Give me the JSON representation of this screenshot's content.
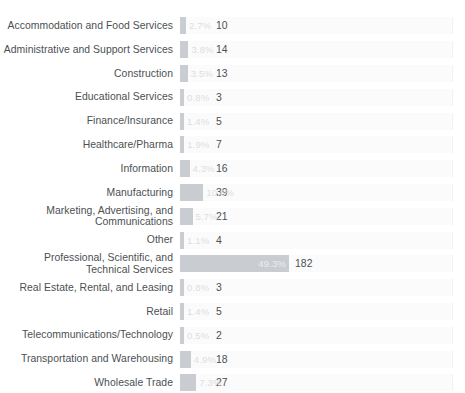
{
  "chart_data": {
    "type": "bar",
    "orientation": "horizontal",
    "title": "",
    "subtitle": "",
    "xlabel": "",
    "ylabel": "",
    "grid": false,
    "legend": null,
    "xlim": [
      0,
      49.3
    ],
    "value_unit": "percent",
    "categories": [
      "Accommodation and Food Services",
      "Administrative and Support Services",
      "Construction",
      "Educational Services",
      "Finance/Insurance",
      "Healthcare/Pharma",
      "Information",
      "Manufacturing",
      "Marketing, Advertising, and\nCommunications",
      "Other",
      "Professional, Scientific, and\nTechnical Services",
      "Real Estate, Rental, and Leasing",
      "Retail",
      "Telecommunications/Technology",
      "Transportation and Warehousing",
      "Wholesale Trade"
    ],
    "values": [
      2.7,
      3.8,
      3.5,
      0.8,
      1.4,
      1.9,
      4.3,
      10.6,
      5.7,
      1.1,
      49.3,
      0.8,
      1.4,
      0.5,
      4.9,
      7.3
    ],
    "counts": [
      10,
      14,
      13,
      3,
      5,
      7,
      16,
      39,
      21,
      4,
      182,
      3,
      5,
      2,
      18,
      27
    ],
    "percent_labels": [
      "2.7%",
      "3.8%",
      "3.5%",
      "0.8%",
      "1.4%",
      "1.9%",
      "4.3%",
      "10.6%",
      "5.7%",
      "1.1%",
      "49.3%",
      "0.8%",
      "1.4%",
      "0.5%",
      "4.9%",
      "7.3%"
    ],
    "count_labels": [
      "10",
      "14",
      "13",
      "3",
      "5",
      "7",
      "16",
      "39",
      "21",
      "4",
      "182",
      "3",
      "5",
      "2",
      "18",
      "27"
    ]
  },
  "style": {
    "bar_color": "#c9ccd0",
    "track_color": "#fbfbfc",
    "track_border_color": "#f2f2f4",
    "label_color": "#4c4f52",
    "percent_label_color": "#eceef0",
    "background": "#ffffff"
  },
  "rows": [
    {
      "label": "Accommodation and Food Services",
      "percent": "2.7%",
      "count": "10",
      "value": 2.7
    },
    {
      "label": "Administrative and Support Services",
      "percent": "3.8%",
      "count": "14",
      "value": 3.8
    },
    {
      "label": "Construction",
      "percent": "3.5%",
      "count": "13",
      "value": 3.5
    },
    {
      "label": "Educational Services",
      "percent": "0.8%",
      "count": "3",
      "value": 0.8
    },
    {
      "label": "Finance/Insurance",
      "percent": "1.4%",
      "count": "5",
      "value": 1.4
    },
    {
      "label": "Healthcare/Pharma",
      "percent": "1.9%",
      "count": "7",
      "value": 1.9
    },
    {
      "label": "Information",
      "percent": "4.3%",
      "count": "16",
      "value": 4.3
    },
    {
      "label": "Manufacturing",
      "percent": "10.6%",
      "count": "39",
      "value": 10.6
    },
    {
      "label": "Marketing, Advertising, and\nCommunications",
      "percent": "5.7%",
      "count": "21",
      "value": 5.7
    },
    {
      "label": "Other",
      "percent": "1.1%",
      "count": "4",
      "value": 1.1
    },
    {
      "label": "Professional, Scientific, and\nTechnical Services",
      "percent": "49.3%",
      "count": "182",
      "value": 49.3
    },
    {
      "label": "Real Estate, Rental, and Leasing",
      "percent": "0.8%",
      "count": "3",
      "value": 0.8
    },
    {
      "label": "Retail",
      "percent": "1.4%",
      "count": "5",
      "value": 1.4
    },
    {
      "label": "Telecommunications/Technology",
      "percent": "0.5%",
      "count": "2",
      "value": 0.5
    },
    {
      "label": "Transportation and Warehousing",
      "percent": "4.9%",
      "count": "18",
      "value": 4.9
    },
    {
      "label": "Wholesale Trade",
      "percent": "7.3%",
      "count": "27",
      "value": 7.3
    }
  ]
}
